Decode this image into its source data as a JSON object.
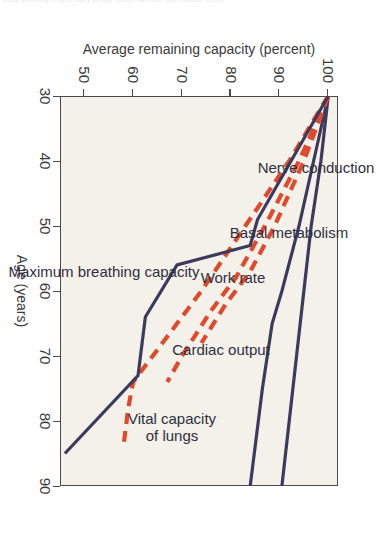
{
  "caption": {
    "partial_text": "occur primarily in sedentary people (after Harrison and Hudson 2000)"
  },
  "colors": {
    "plot_background": "#f3f1e9",
    "page_background": "#ffffff",
    "axis": "#4b4b4b",
    "solid_series": "#3d3a5e",
    "dashed_series": "#e04a2b",
    "text": "#3a3a3a"
  },
  "chart_data": {
    "type": "line",
    "title": "",
    "subtitle": "",
    "orientation": "rotated-90-clockwise",
    "xlabel": "Age (years)",
    "ylabel": "Average remaining capacity (percent)",
    "xlim": [
      30,
      90
    ],
    "ylim": [
      45,
      102
    ],
    "xticks": [
      30,
      40,
      50,
      60,
      70,
      80,
      90
    ],
    "xticklabels": [
      "30",
      "40",
      "50",
      "60",
      "70",
      "80",
      "90"
    ],
    "yticks": [
      100,
      90,
      80,
      70,
      60,
      50
    ],
    "yticklabels": [
      "100",
      "90",
      "80",
      "70",
      "60",
      "50"
    ],
    "grid": false,
    "legend": "inline-labels",
    "series": [
      {
        "name": "Nerve conduction",
        "style": "solid",
        "color": "#3d3a5e",
        "label_x": 41,
        "label_y": 97.5,
        "points": [
          {
            "age": 30,
            "capacity": 100
          },
          {
            "age": 40,
            "capacity": 98.5
          },
          {
            "age": 50,
            "capacity": 96.5
          },
          {
            "age": 60,
            "capacity": 95
          },
          {
            "age": 70,
            "capacity": 93.5
          },
          {
            "age": 80,
            "capacity": 92
          },
          {
            "age": 90,
            "capacity": 90.5
          }
        ]
      },
      {
        "name": "Basal metabolism",
        "style": "solid",
        "color": "#3d3a5e",
        "label_x": 51,
        "label_y": 92,
        "points": [
          {
            "age": 30,
            "capacity": 100
          },
          {
            "age": 40,
            "capacity": 97
          },
          {
            "age": 50,
            "capacity": 94
          },
          {
            "age": 60,
            "capacity": 90.5
          },
          {
            "age": 65,
            "capacity": 88.5
          },
          {
            "age": 75,
            "capacity": 86.5
          },
          {
            "age": 90,
            "capacity": 84
          }
        ]
      },
      {
        "name": "Work rate",
        "style": "dashed",
        "color": "#e04a2b",
        "label_x": 58,
        "label_y": 80.5,
        "points": [
          {
            "age": 30,
            "capacity": 100
          },
          {
            "age": 40,
            "capacity": 95
          },
          {
            "age": 50,
            "capacity": 89
          },
          {
            "age": 57,
            "capacity": 84
          },
          {
            "age": 62,
            "capacity": 79
          },
          {
            "age": 68,
            "capacity": 74
          }
        ]
      },
      {
        "name": "Cardiac output",
        "style": "dashed",
        "color": "#e04a2b",
        "label_x": 69,
        "label_y": 78,
        "points": [
          {
            "age": 30,
            "capacity": 100
          },
          {
            "age": 40,
            "capacity": 94
          },
          {
            "age": 50,
            "capacity": 87
          },
          {
            "age": 58,
            "capacity": 81
          },
          {
            "age": 63,
            "capacity": 76
          },
          {
            "age": 70,
            "capacity": 70
          },
          {
            "age": 74,
            "capacity": 67
          }
        ]
      },
      {
        "name": "Vital capacity\nof lungs",
        "style": "dashed",
        "color": "#e04a2b",
        "label_x": 81,
        "label_y": 68,
        "points": [
          {
            "age": 30,
            "capacity": 100
          },
          {
            "age": 40,
            "capacity": 92
          },
          {
            "age": 50,
            "capacity": 83
          },
          {
            "age": 60,
            "capacity": 74
          },
          {
            "age": 68,
            "capacity": 66
          },
          {
            "age": 74,
            "capacity": 60
          },
          {
            "age": 78,
            "capacity": 59
          },
          {
            "age": 84,
            "capacity": 58
          }
        ]
      },
      {
        "name": "Maximum breathing capacity",
        "style": "solid",
        "color": "#3d3a5e",
        "label_x": 57,
        "label_y": 54,
        "points": [
          {
            "age": 30,
            "capacity": 100
          },
          {
            "age": 49,
            "capacity": 85.5
          },
          {
            "age": 53,
            "capacity": 84
          },
          {
            "age": 56,
            "capacity": 69
          },
          {
            "age": 64,
            "capacity": 62.5
          },
          {
            "age": 73,
            "capacity": 61
          },
          {
            "age": 85,
            "capacity": 46
          }
        ]
      }
    ]
  }
}
